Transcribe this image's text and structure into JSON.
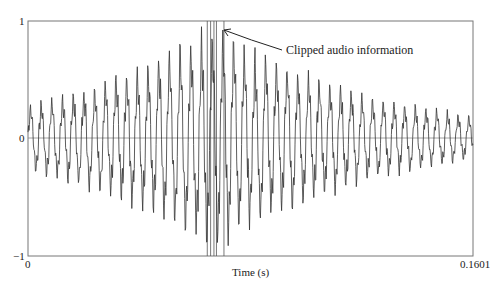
{
  "chart_data": {
    "type": "line",
    "title": "",
    "xlabel": "Time (s)",
    "ylabel": "",
    "xlim": [
      0,
      0.1601
    ],
    "ylim": [
      -1,
      1
    ],
    "x_tick_labels": [
      "0",
      "0.1601"
    ],
    "y_tick_labels": [
      "1",
      "0",
      "-1"
    ],
    "grid": false,
    "zero_line": true,
    "series": [
      {
        "name": "audio waveform",
        "description": "Oscillating audio signal with amplitude growing from ~0.3 at start to clipping at ±1 around t≈0.065–0.07 s, then decaying to ~0.2 near the end",
        "envelope": {
          "t": [
            0,
            0.02,
            0.04,
            0.055,
            0.065,
            0.07,
            0.08,
            0.1,
            0.12,
            0.14,
            0.1601
          ],
          "amplitude": [
            0.3,
            0.45,
            0.65,
            0.85,
            1.0,
            1.0,
            0.8,
            0.6,
            0.4,
            0.3,
            0.2
          ]
        },
        "clipped_region_t": [
          0.0645,
          0.0705
        ]
      }
    ],
    "annotations": [
      {
        "text": "Clipped audio information",
        "arrow_to_t": 0.0705,
        "arrow_to_y": 0.95
      }
    ]
  },
  "labels": {
    "y_top": "1",
    "y_mid": "0",
    "y_bot": "−1",
    "x_left": "0",
    "x_right": "0.1601",
    "x_axis": "Time (s)",
    "annotation": "Clipped audio information"
  }
}
